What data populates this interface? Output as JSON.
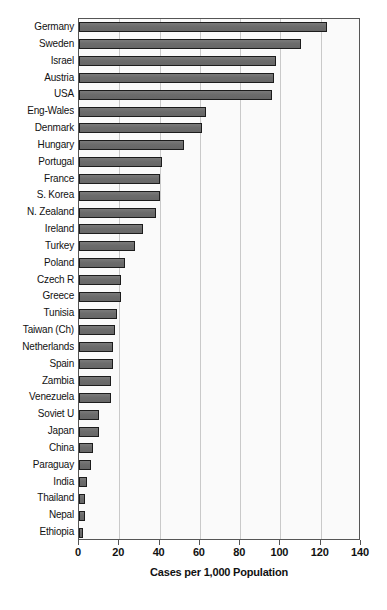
{
  "chart_data": {
    "type": "bar",
    "orientation": "horizontal",
    "title": "",
    "xlabel": "Cases per 1,000 Population",
    "ylabel": "",
    "xlim": [
      0,
      140
    ],
    "xticks": [
      0,
      20,
      40,
      60,
      80,
      100,
      120,
      140
    ],
    "grid": true,
    "legend": false,
    "bar_color": "#6e6e6e",
    "bar_edge_color": "#1c1c1c",
    "plot_bg_color": "#fafafa",
    "categories": [
      "Germany",
      "Sweden",
      "Israel",
      "Austria",
      "USA",
      "Eng-Wales",
      "Denmark",
      "Hungary",
      "Portugal",
      "France",
      "S. Korea",
      "N. Zealand",
      "Ireland",
      "Turkey",
      "Poland",
      "Czech R",
      "Greece",
      "Tunisia",
      "Taiwan (Ch)",
      "Netherlands",
      "Spain",
      "Zambia",
      "Venezuela",
      "Soviet U",
      "Japan",
      "China",
      "Paraguay",
      "India",
      "Thailand",
      "Nepal",
      "Ethiopia"
    ],
    "values": [
      123,
      110,
      98,
      97,
      96,
      63,
      61,
      52,
      41,
      40,
      40,
      38,
      32,
      28,
      23,
      21,
      21,
      19,
      18,
      17,
      17,
      16,
      16,
      10,
      10,
      7,
      6,
      4,
      3,
      3,
      2
    ]
  }
}
